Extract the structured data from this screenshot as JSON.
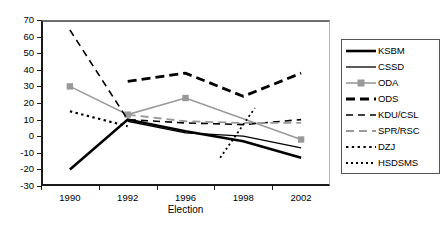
{
  "chart_data": {
    "type": "line",
    "title": "",
    "xlabel": "Election",
    "ylabel": "",
    "categories": [
      "1990",
      "1992",
      "1996",
      "1998",
      "2002"
    ],
    "x_values": [
      1990,
      1992,
      1996,
      1998,
      2002
    ],
    "ylim": [
      -30,
      70
    ],
    "ytick_labels": [
      "70",
      "60",
      "50",
      "40",
      "30",
      "20",
      "10",
      "0",
      "-10",
      "-20",
      "-30"
    ],
    "ytick_values": [
      70,
      60,
      50,
      40,
      30,
      20,
      10,
      0,
      -10,
      -20,
      -30
    ],
    "grid": false,
    "legend_position": "right",
    "series": [
      {
        "name": "KSBM",
        "style": "thick-solid-black",
        "color": "#000000",
        "x": [
          1990,
          1992,
          1996,
          1998,
          2002
        ],
        "values": [
          -20,
          10,
          3,
          -3,
          -13
        ]
      },
      {
        "name": "CSSD",
        "style": "thin-solid-black",
        "color": "#000000",
        "x": [
          1992,
          1996,
          1998,
          2002
        ],
        "values": [
          9,
          2,
          0,
          -7
        ]
      },
      {
        "name": "ODA",
        "style": "solid-gray-square-markers",
        "color": "#999999",
        "x": [
          1990,
          1992,
          1996,
          2002
        ],
        "values": [
          30,
          13,
          23,
          -2
        ]
      },
      {
        "name": "ODS",
        "style": "thick-dashed-black",
        "color": "#000000",
        "x": [
          1992,
          1996,
          1998,
          2002
        ],
        "values": [
          33,
          38,
          24,
          38
        ]
      },
      {
        "name": "KDU/CSL",
        "style": "thin-dashed-black",
        "color": "#000000",
        "x": [
          1990,
          1992,
          1996,
          1998,
          2002
        ],
        "values": [
          64,
          10,
          8,
          7,
          10
        ]
      },
      {
        "name": "SPR/RSC",
        "style": "dashed-gray",
        "color": "#999999",
        "x": [
          1992,
          1996,
          1998,
          2002
        ],
        "values": [
          13,
          9,
          8,
          8
        ]
      },
      {
        "name": "DZJ",
        "style": "dotted-black",
        "color": "#000000",
        "x": [
          1990,
          1992
        ],
        "values": [
          15,
          6
        ]
      },
      {
        "name": "HSDSMS",
        "style": "fine-dotted-black",
        "color": "#000000",
        "x": [
          1997.2,
          1998.8
        ],
        "values": [
          -13,
          17
        ]
      }
    ]
  },
  "legend": {
    "entries": [
      {
        "label": "KSBM"
      },
      {
        "label": "CSSD"
      },
      {
        "label": "ODA"
      },
      {
        "label": "ODS"
      },
      {
        "label": "KDU/CSL"
      },
      {
        "label": "SPR/RSC"
      },
      {
        "label": "DZJ"
      },
      {
        "label": "HSDSMS"
      }
    ]
  }
}
